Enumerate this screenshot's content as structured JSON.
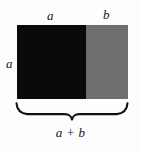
{
  "figure": {
    "kind": "geometry-diagram",
    "background_color": "#fdfdfd"
  },
  "rectangle": {
    "segments": [
      {
        "id": "segment-a",
        "label": "a",
        "color": "#0a0a0a",
        "width_px": 68.5
      },
      {
        "id": "segment-b",
        "label": "b",
        "color": "#6e6e6e",
        "width_px": 42.5
      }
    ],
    "height_label": "a",
    "total_width_label": "a + b"
  },
  "labels": {
    "top_left": "a",
    "top_right": "b",
    "side_left": "a",
    "bottom_total": "a + b"
  },
  "brace": {
    "name": "underbrace",
    "orientation": "down",
    "stroke_color": "#111111"
  },
  "colors": {
    "black": "#0a0a0a",
    "gray": "#6e6e6e",
    "text": "#161616",
    "background": "#fdfdfd"
  }
}
